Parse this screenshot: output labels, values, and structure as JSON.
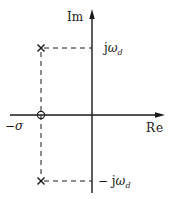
{
  "diagram": {
    "type": "s-plane pole-zero plot",
    "axes": {
      "imaginary_label": "Im",
      "real_label": "Re"
    },
    "labels": {
      "upper_prefix": "j",
      "upper_symbol": "ω",
      "upper_sub": "d",
      "lower_prefix": "− j",
      "lower_symbol": "ω",
      "lower_sub": "d",
      "sigma_prefix": "−",
      "sigma_symbol": "σ"
    },
    "markers": [
      {
        "kind": "pole",
        "glyph": "×",
        "position": "-σ + jω_d"
      },
      {
        "kind": "pole",
        "glyph": "×",
        "position": "-σ - jω_d"
      },
      {
        "kind": "zero",
        "glyph": "○",
        "position": "-σ"
      }
    ],
    "colors": {
      "line": "#1a1a1a",
      "background": "#ffffff"
    }
  }
}
